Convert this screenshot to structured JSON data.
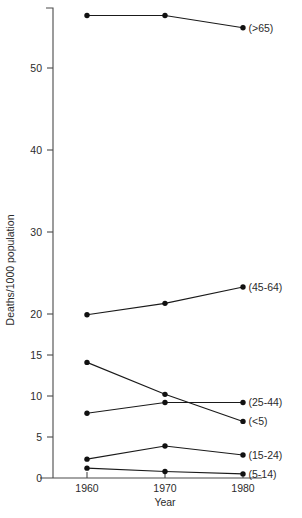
{
  "chart_data": {
    "type": "line",
    "title": "",
    "xlabel": "Year",
    "ylabel": "Deaths/1000 population",
    "x": [
      1960,
      1970,
      1980
    ],
    "xtick_labels": [
      "1960",
      "1970",
      "1980"
    ],
    "ytick_labels": [
      "0",
      "5",
      "10",
      "15",
      "20",
      "30",
      "40",
      "50"
    ],
    "ytick_values": [
      0,
      5,
      10,
      15,
      20,
      30,
      40,
      50
    ],
    "ylim": [
      0,
      57.5
    ],
    "xlim": [
      1955,
      1984
    ],
    "grid": false,
    "legend_position": "right-inline-end-of-line",
    "series": [
      {
        "name": "(>65)",
        "label": "(>65)",
        "values": [
          56.4,
          56.4,
          54.9
        ]
      },
      {
        "name": "(45-64)",
        "label": "(45-64)",
        "values": [
          19.9,
          21.3,
          23.3
        ]
      },
      {
        "name": "(<5)",
        "label": "(<5)",
        "values": [
          14.1,
          10.2,
          6.9
        ]
      },
      {
        "name": "(25-44)",
        "label": "(25-44)",
        "values": [
          7.9,
          9.2,
          9.2
        ]
      },
      {
        "name": "(15-24)",
        "label": "(15-24)",
        "values": [
          2.3,
          3.9,
          2.8
        ]
      },
      {
        "name": "(5-14)",
        "label": "(5-14)",
        "values": [
          1.2,
          0.8,
          0.5
        ]
      }
    ],
    "colors": {
      "line": "#1a1a1a",
      "marker": "#111111",
      "axis": "#4a4a4a",
      "text": "#2b2b2b",
      "background": "#ffffff"
    }
  }
}
